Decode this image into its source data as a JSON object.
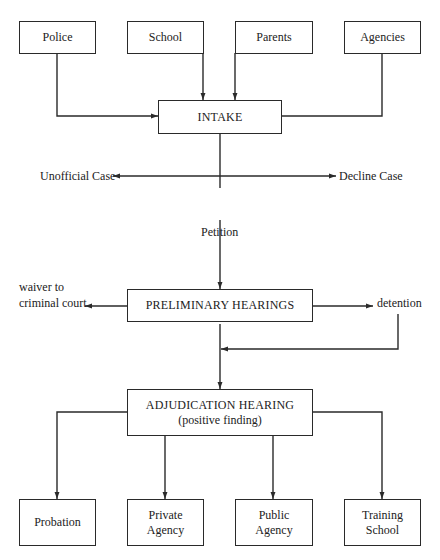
{
  "diagram": {
    "type": "flowchart",
    "sources": [
      {
        "id": "police",
        "label": "Police"
      },
      {
        "id": "school",
        "label": "School"
      },
      {
        "id": "parents",
        "label": "Parents"
      },
      {
        "id": "agencies",
        "label": "Agencies"
      }
    ],
    "intake": {
      "label": "INTAKE"
    },
    "intake_branches": {
      "left": "Unofficial Case",
      "right": "Decline Case",
      "down": "Petition"
    },
    "preliminary": {
      "label": "PRELIMINARY HEARINGS"
    },
    "preliminary_branches": {
      "left_line1": "waiver to",
      "left_line2": "criminal court",
      "right": "detention"
    },
    "adjudication": {
      "label": "ADJUDICATION HEARING",
      "sublabel": "(positive finding)"
    },
    "outcomes": [
      {
        "id": "probation",
        "line1": "Probation",
        "line2": ""
      },
      {
        "id": "private-agency",
        "line1": "Private",
        "line2": "Agency"
      },
      {
        "id": "public-agency",
        "line1": "Public",
        "line2": "Agency"
      },
      {
        "id": "training-school",
        "line1": "Training",
        "line2": "School"
      }
    ],
    "edges": [
      {
        "from": "Police",
        "to": "INTAKE",
        "arrow": true
      },
      {
        "from": "School",
        "to": "INTAKE",
        "arrow": true
      },
      {
        "from": "Parents",
        "to": "INTAKE",
        "arrow": true
      },
      {
        "from": "Agencies",
        "to": "INTAKE",
        "arrow": false
      },
      {
        "from": "INTAKE",
        "to": "Unofficial Case",
        "arrow": true
      },
      {
        "from": "INTAKE",
        "to": "Decline Case",
        "arrow": true
      },
      {
        "from": "INTAKE",
        "to": "PRELIMINARY HEARINGS",
        "label": "Petition",
        "arrow": true
      },
      {
        "from": "PRELIMINARY HEARINGS",
        "to": "waiver to criminal court",
        "arrow": true
      },
      {
        "from": "PRELIMINARY HEARINGS",
        "to": "detention",
        "arrow": true
      },
      {
        "from": "detention",
        "to": "ADJUDICATION HEARING",
        "arrow": true
      },
      {
        "from": "PRELIMINARY HEARINGS",
        "to": "ADJUDICATION HEARING",
        "arrow": true
      },
      {
        "from": "ADJUDICATION HEARING",
        "to": "Probation",
        "arrow": true
      },
      {
        "from": "ADJUDICATION HEARING",
        "to": "Private Agency",
        "arrow": true
      },
      {
        "from": "ADJUDICATION HEARING",
        "to": "Public Agency",
        "arrow": true
      },
      {
        "from": "ADJUDICATION HEARING",
        "to": "Training School",
        "arrow": true
      }
    ]
  },
  "colors": {
    "stroke": "#2a2a2a",
    "background": "#ffffff"
  }
}
